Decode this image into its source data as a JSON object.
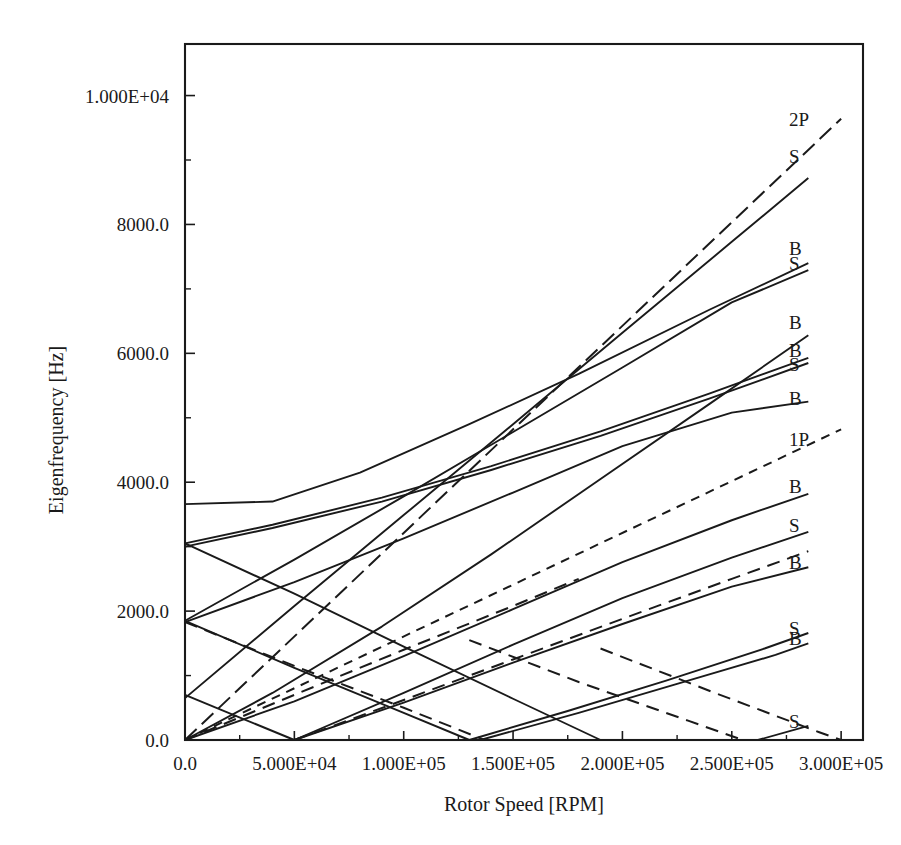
{
  "chart_data": {
    "type": "line",
    "title": "",
    "xlabel": "Rotor Speed [RPM]",
    "ylabel": "Eigenfrequency [Hz]",
    "xlim": [
      0,
      310000
    ],
    "ylim": [
      0,
      10800
    ],
    "grid": false,
    "legend_position": "right-inline-labels",
    "xticks": [
      0,
      50000,
      100000,
      150000,
      200000,
      250000,
      300000
    ],
    "xtick_labels": [
      "0.0",
      "5.000E+04",
      "1.000E+05",
      "1.500E+05",
      "2.000E+05",
      "2.500E+05",
      "3.000E+05"
    ],
    "yticks": [
      0,
      2000,
      4000,
      6000,
      8000,
      10000
    ],
    "ytick_labels": [
      "0.0",
      "2000.0",
      "4000.0",
      "6000.0",
      "8000.0",
      "1.000E+04"
    ],
    "x_minor_ticks": [
      25000,
      75000,
      125000,
      175000,
      225000,
      275000
    ],
    "y_minor_ticks": [
      1000,
      3000,
      5000,
      7000,
      9000
    ],
    "series": [
      {
        "name": "2P",
        "label": "2P",
        "style": "dash-long",
        "label_y": 9640,
        "points": [
          [
            0,
            0
          ],
          [
            300000,
            9640
          ]
        ]
      },
      {
        "name": "S-forward-6",
        "label": "S",
        "style": "solid",
        "label_y": 9060,
        "points": [
          [
            0,
            650
          ],
          [
            50000,
            2080
          ],
          [
            100000,
            3490
          ],
          [
            150000,
            4900
          ],
          [
            200000,
            6320
          ],
          [
            250000,
            7730
          ],
          [
            285000,
            8720
          ]
        ]
      },
      {
        "name": "B-forward-5",
        "label": "B",
        "style": "solid",
        "label_y": 7630,
        "points": [
          [
            0,
            3660
          ],
          [
            40000,
            3700
          ],
          [
            80000,
            4150
          ],
          [
            130000,
            4900
          ],
          [
            180000,
            5680
          ],
          [
            240000,
            6680
          ],
          [
            285000,
            7400
          ]
        ]
      },
      {
        "name": "S-forward-5",
        "label": "S",
        "style": "solid",
        "label_y": 7400,
        "points": [
          [
            0,
            1850
          ],
          [
            50000,
            2800
          ],
          [
            100000,
            3780
          ],
          [
            150000,
            4780
          ],
          [
            200000,
            5780
          ],
          [
            250000,
            6790
          ],
          [
            285000,
            7290
          ]
        ]
      },
      {
        "name": "B-forward-4",
        "label": "B",
        "style": "solid",
        "label_y": 6480,
        "points": [
          [
            0,
            0
          ],
          [
            40000,
            730
          ],
          [
            90000,
            1760
          ],
          [
            140000,
            2880
          ],
          [
            190000,
            4050
          ],
          [
            240000,
            5220
          ],
          [
            285000,
            6280
          ]
        ]
      },
      {
        "name": "B-forward-3",
        "label": "B",
        "style": "solid",
        "label_y": 6050,
        "points": [
          [
            0,
            3050
          ],
          [
            40000,
            3340
          ],
          [
            90000,
            3760
          ],
          [
            140000,
            4250
          ],
          [
            190000,
            4790
          ],
          [
            240000,
            5380
          ],
          [
            285000,
            5930
          ]
        ]
      },
      {
        "name": "S-forward-4",
        "label": "S",
        "style": "solid",
        "label_y": 5830,
        "points": [
          [
            0,
            3000
          ],
          [
            40000,
            3290
          ],
          [
            90000,
            3700
          ],
          [
            140000,
            4190
          ],
          [
            190000,
            4720
          ],
          [
            240000,
            5300
          ],
          [
            285000,
            5850
          ]
        ]
      },
      {
        "name": "B-forward-2",
        "label": "B",
        "style": "solid",
        "label_y": 5300,
        "points": [
          [
            0,
            1830
          ],
          [
            50000,
            2450
          ],
          [
            100000,
            3130
          ],
          [
            150000,
            3840
          ],
          [
            200000,
            4560
          ],
          [
            250000,
            5080
          ],
          [
            285000,
            5250
          ]
        ]
      },
      {
        "name": "1P",
        "label": "1P",
        "style": "dash-short",
        "label_y": 4670,
        "points": [
          [
            0,
            0
          ],
          [
            300000,
            4820
          ]
        ]
      },
      {
        "name": "B-forward-1",
        "label": "B",
        "style": "solid",
        "label_y": 3940,
        "points": [
          [
            0,
            0
          ],
          [
            50000,
            600
          ],
          [
            100000,
            1300
          ],
          [
            150000,
            2030
          ],
          [
            200000,
            2760
          ],
          [
            250000,
            3410
          ],
          [
            285000,
            3820
          ]
        ]
      },
      {
        "name": "S-forward-3",
        "label": "S",
        "style": "solid",
        "label_y": 3330,
        "points": [
          [
            50000,
            0
          ],
          [
            100000,
            730
          ],
          [
            150000,
            1480
          ],
          [
            200000,
            2200
          ],
          [
            250000,
            2830
          ],
          [
            285000,
            3230
          ]
        ]
      },
      {
        "name": "S-forward-2",
        "label": "B",
        "style": "solid",
        "label_y": 2760,
        "points": [
          [
            50000,
            0
          ],
          [
            100000,
            580
          ],
          [
            150000,
            1200
          ],
          [
            200000,
            1800
          ],
          [
            250000,
            2380
          ],
          [
            285000,
            2680
          ]
        ]
      },
      {
        "name": "S-forward-0",
        "label": "S",
        "style": "solid",
        "label_y": 1740,
        "points": [
          [
            130000,
            0
          ],
          [
            175000,
            450
          ],
          [
            220000,
            920
          ],
          [
            265000,
            1420
          ],
          [
            285000,
            1660
          ]
        ]
      },
      {
        "name": "B-forward-0",
        "label": "B",
        "style": "solid",
        "label_y": 1590,
        "points": [
          [
            135000,
            0
          ],
          [
            180000,
            420
          ],
          [
            225000,
            870
          ],
          [
            270000,
            1320
          ],
          [
            285000,
            1500
          ]
        ]
      },
      {
        "name": "S-lowest",
        "label": "S",
        "style": "solid",
        "label_y": 290,
        "points": [
          [
            262000,
            0
          ],
          [
            285000,
            220
          ]
        ]
      },
      {
        "name": "B-backward-5",
        "label": "",
        "style": "solid",
        "label_y": null,
        "points": [
          [
            0,
            3050
          ],
          [
            50000,
            2270
          ],
          [
            100000,
            1450
          ],
          [
            150000,
            640
          ],
          [
            190000,
            0
          ]
        ]
      },
      {
        "name": "B-backward-4",
        "label": "",
        "style": "solid",
        "label_y": null,
        "points": [
          [
            0,
            1850
          ],
          [
            50000,
            1120
          ],
          [
            100000,
            420
          ],
          [
            130000,
            0
          ]
        ]
      },
      {
        "name": "B-backward-3",
        "label": "",
        "style": "solid",
        "label_y": null,
        "points": [
          [
            0,
            700
          ],
          [
            50000,
            0
          ]
        ]
      },
      {
        "name": "BW-dashed-1",
        "label": "",
        "style": "dash-bw",
        "label_y": null,
        "points": [
          [
            0,
            1830
          ],
          [
            50000,
            1150
          ],
          [
            100000,
            500
          ],
          [
            137000,
            0
          ]
        ]
      },
      {
        "name": "BW-dashed-2",
        "label": "",
        "style": "dash-bw",
        "label_y": null,
        "points": [
          [
            0,
            0
          ],
          [
            50000,
            700
          ],
          [
            100000,
            1400
          ],
          [
            150000,
            2080
          ],
          [
            180000,
            2500
          ]
        ]
      },
      {
        "name": "BW-dashed-3",
        "label": "",
        "style": "dash-bw",
        "label_y": null,
        "points": [
          [
            50000,
            0
          ],
          [
            100000,
            620
          ],
          [
            150000,
            1250
          ],
          [
            200000,
            1880
          ],
          [
            250000,
            2500
          ],
          [
            285000,
            2930
          ]
        ]
      },
      {
        "name": "BW-dashed-4",
        "label": "",
        "style": "dash-bw",
        "label_y": null,
        "points": [
          [
            130000,
            1550
          ],
          [
            180000,
            900
          ],
          [
            230000,
            300
          ],
          [
            255000,
            0
          ]
        ]
      },
      {
        "name": "BW-dashed-5",
        "label": "",
        "style": "dash-bw",
        "label_y": null,
        "points": [
          [
            190000,
            1420
          ],
          [
            240000,
            760
          ],
          [
            290000,
            120
          ],
          [
            300000,
            0
          ]
        ]
      }
    ]
  }
}
